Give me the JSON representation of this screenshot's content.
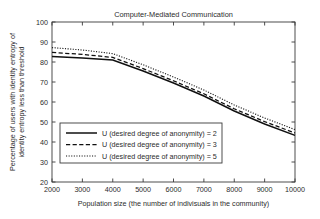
{
  "chart_data": {
    "type": "line",
    "title": "Computer-Mediated Communication",
    "xlabel": "Population size (the number of indivisuals in the community)",
    "ylabel_line1": "Percentage of users with identity entropy of",
    "ylabel_line2": "identity entropy less than threshold",
    "x": [
      2000,
      3000,
      4000,
      5000,
      6000,
      7000,
      8000,
      9000,
      10000
    ],
    "xlim": [
      2000,
      10000
    ],
    "ylim": [
      20,
      100
    ],
    "xticks": [
      "2000",
      "3000",
      "4000",
      "5000",
      "6000",
      "7000",
      "8000",
      "9000",
      "10000"
    ],
    "yticks": [
      "20",
      "30",
      "40",
      "50",
      "60",
      "70",
      "80",
      "90",
      "100"
    ],
    "grid": false,
    "legend_position": "lower-left",
    "series": [
      {
        "name": "U (desired degree of anonymity) = 2",
        "style": "solid",
        "color": "#101010",
        "values": [
          82.8,
          82.0,
          81.0,
          75.5,
          69.5,
          63.0,
          55.5,
          49.0,
          43.3
        ]
      },
      {
        "name": "U (desired degree of anonymity) = 3",
        "style": "dashed",
        "color": "#101010",
        "values": [
          84.8,
          83.8,
          82.3,
          76.7,
          70.6,
          64.1,
          56.6,
          50.2,
          44.5
        ]
      },
      {
        "name": "U (desired degree of anonymity) = 5",
        "style": "dotted",
        "color": "#101010",
        "values": [
          87.2,
          86.0,
          84.2,
          78.6,
          72.5,
          66.0,
          58.5,
          52.0,
          46.2
        ]
      }
    ]
  }
}
